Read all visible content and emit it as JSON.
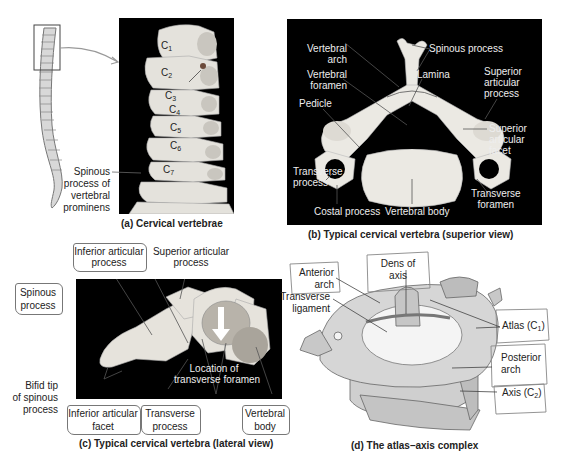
{
  "panels": {
    "a": {
      "caption": "(a) Cervical vertebrae",
      "vertebra_labels": [
        "C1",
        "C2",
        "C3",
        "C4",
        "C5",
        "C6",
        "C7"
      ],
      "spinous_label": [
        "Spinous",
        "process of",
        "vertebral",
        "prominens"
      ]
    },
    "b": {
      "caption": "(b) Typical cervical vertebra (superior view)",
      "labels": {
        "vertebral_arch": [
          "Vertebral",
          "arch"
        ],
        "spinous_process": "Spinous process",
        "vertebral_foramen": [
          "Vertebral",
          "foramen"
        ],
        "lamina": "Lamina",
        "superior_articular_process": [
          "Superior",
          "articular",
          "process"
        ],
        "pedicle": "Pedicle",
        "superior_articular_facet": [
          "Superior",
          "articular",
          "facet"
        ],
        "transverse_process": [
          "Transverse",
          "process"
        ],
        "transverse_foramen": [
          "Transverse",
          "foramen"
        ],
        "costal_process": "Costal process",
        "vertebral_body": "Vertebral body"
      }
    },
    "c": {
      "caption": "(c) Typical cervical vertebra (lateral view)",
      "labels": {
        "inferior_articular_process": [
          "Inferior articular",
          "process"
        ],
        "superior_articular_process": [
          "Superior articular",
          "process"
        ],
        "spinous_process": [
          "Spinous",
          "process"
        ],
        "bifid_tip": [
          "Bifid tip",
          "of spinous",
          "process"
        ],
        "inferior_articular_facet": [
          "Inferior articular",
          "facet"
        ],
        "transverse_process": [
          "Transverse",
          "process"
        ],
        "location_transverse_foramen": [
          "Location of",
          "transverse foramen"
        ],
        "vertebral_body": [
          "Vertebral",
          "body"
        ]
      }
    },
    "d": {
      "caption": "(d) The atlas–axis complex",
      "labels": {
        "dens_of_axis": [
          "Dens of",
          "axis"
        ],
        "anterior_arch": [
          "Anterior",
          "arch"
        ],
        "transverse_ligament": [
          "Transverse",
          "ligament"
        ],
        "atlas": "Atlas (C",
        "atlas_sub": "1",
        "posterior_arch": [
          "Posterior",
          "arch"
        ],
        "axis": "Axis (C",
        "axis_sub": "2"
      }
    }
  },
  "colors": {
    "panel_bg": "#000000",
    "bone": "#e8e6e0",
    "bone_shadow": "#b8b5ae",
    "line": "#555555",
    "text": "#222222"
  }
}
